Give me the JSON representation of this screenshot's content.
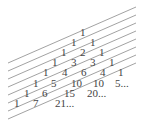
{
  "diagram": {
    "colors": {
      "text": "#444444",
      "lines": "#8a8a8a",
      "background": "#ffffff"
    },
    "rows": [
      {
        "values": [
          "1"
        ],
        "x": [
          80
        ],
        "y": 36
      },
      {
        "values": [
          "1",
          "1"
        ],
        "x": [
          71,
          90
        ],
        "y": 46
      },
      {
        "values": [
          "1",
          "2",
          "1"
        ],
        "x": [
          61,
          80,
          99
        ],
        "y": 56
      },
      {
        "values": [
          "1",
          "3",
          "3",
          "1"
        ],
        "x": [
          52,
          71,
          90,
          109
        ],
        "y": 66
      },
      {
        "values": [
          "1",
          "4",
          "6",
          "4",
          "1"
        ],
        "x": [
          43,
          62,
          81,
          100,
          118
        ],
        "y": 76
      },
      {
        "values": [
          "1",
          "5",
          "10",
          "10",
          "5..."
        ],
        "x": [
          33,
          51,
          71,
          93,
          115
        ],
        "y": 87
      },
      {
        "values": [
          "1",
          "6",
          "15",
          "20..."
        ],
        "x": [
          24,
          42,
          64,
          87
        ],
        "y": 97
      },
      {
        "values": [
          "1",
          "7",
          "21..."
        ],
        "x": [
          14,
          33,
          55
        ],
        "y": 107
      }
    ],
    "lines": [
      {
        "x1": 8,
        "y1": 63,
        "x2": 136,
        "y2": 7
      },
      {
        "x1": 8,
        "y1": 71,
        "x2": 136,
        "y2": 15
      },
      {
        "x1": 8,
        "y1": 79,
        "x2": 136,
        "y2": 23
      },
      {
        "x1": 8,
        "y1": 87,
        "x2": 136,
        "y2": 31
      },
      {
        "x1": 8,
        "y1": 95,
        "x2": 136,
        "y2": 39
      },
      {
        "x1": 8,
        "y1": 103,
        "x2": 136,
        "y2": 47
      },
      {
        "x1": 8,
        "y1": 111,
        "x2": 136,
        "y2": 55
      },
      {
        "x1": 8,
        "y1": 119,
        "x2": 136,
        "y2": 63
      }
    ]
  }
}
